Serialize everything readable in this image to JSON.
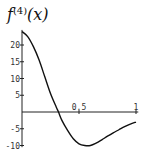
{
  "chart_data": {
    "type": "line",
    "title_parts": {
      "base": "f",
      "sup": "(4)",
      "arg": "(x)"
    },
    "xlabel": "",
    "ylabel": "",
    "xlim": [
      0,
      1
    ],
    "ylim": [
      -10,
      24
    ],
    "x_ticks": [
      0.5,
      1
    ],
    "x_tick_labels": [
      "0.5",
      "1"
    ],
    "y_ticks": [
      -10,
      -5,
      5,
      10,
      15,
      20
    ],
    "y_tick_labels": [
      "-10",
      "-5",
      "5",
      "10",
      "15",
      "20"
    ],
    "grid": false,
    "series": [
      {
        "name": "f^(4)(x)",
        "x": [
          0,
          0.05,
          0.1,
          0.15,
          0.2,
          0.25,
          0.3,
          0.32,
          0.35,
          0.4,
          0.45,
          0.5,
          0.55,
          0.6,
          0.65,
          0.7,
          0.75,
          0.8,
          0.85,
          0.9,
          0.95,
          1.0
        ],
        "y": [
          24,
          22.5,
          19.5,
          15.5,
          10.5,
          5.5,
          1.5,
          0,
          -2.5,
          -5.5,
          -8,
          -9.5,
          -10,
          -10,
          -9.3,
          -8.3,
          -7.2,
          -6.2,
          -5.3,
          -4.4,
          -3.6,
          -3
        ]
      }
    ]
  }
}
